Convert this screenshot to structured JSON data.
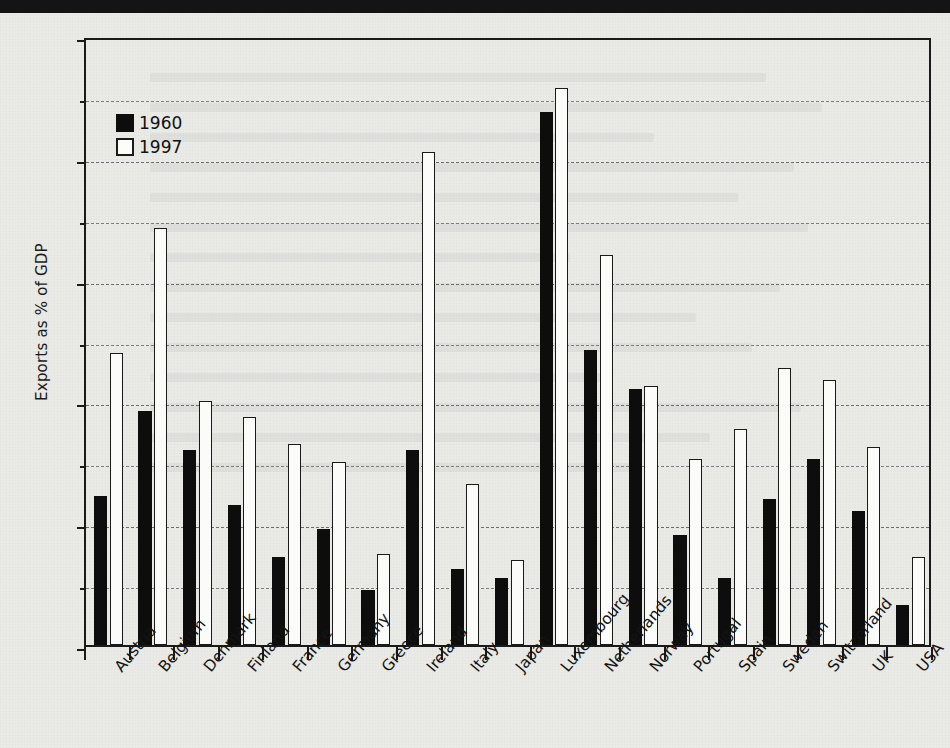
{
  "chart_data": {
    "type": "bar",
    "title": "",
    "subtitle": "",
    "xlabel": "",
    "ylabel": "Exports as % of GDP",
    "ylim": [
      0,
      100
    ],
    "y_ticks": [
      0,
      20,
      40,
      60,
      80,
      100
    ],
    "y_tick_labels": [
      "0",
      "20",
      "40",
      "60",
      "80",
      "100"
    ],
    "y_gridlines": [
      10,
      20,
      30,
      40,
      50,
      60,
      70,
      80,
      90
    ],
    "grid": true,
    "legend_position": "top-left",
    "categories": [
      "Austria",
      "Belgium",
      "Denmark",
      "Finland",
      "France",
      "Germany",
      "Greece",
      "Ireland",
      "Italy",
      "Japan",
      "Luxembourg",
      "Netherlands",
      "Norway",
      "Portugal",
      "Spain",
      "Sweden",
      "Switzerland",
      "UK",
      "USA"
    ],
    "series": [
      {
        "name": "1960",
        "color": "#0d0d0d",
        "values": [
          24.5,
          38.5,
          32.0,
          23.0,
          14.5,
          19.0,
          9.0,
          32.0,
          12.5,
          11.0,
          87.5,
          48.5,
          42.0,
          18.0,
          11.0,
          24.0,
          30.5,
          22.0,
          6.5
        ]
      },
      {
        "name": "1997",
        "color": "#fbfbfa",
        "values": [
          48.0,
          68.5,
          40.0,
          37.5,
          33.0,
          30.0,
          15.0,
          81.0,
          26.5,
          14.0,
          91.5,
          64.0,
          42.5,
          30.5,
          35.5,
          45.5,
          43.5,
          32.5,
          14.5
        ]
      }
    ]
  },
  "legend": {
    "items": [
      {
        "label": "1960",
        "swatch": "filled-black-square"
      },
      {
        "label": "1997",
        "swatch": "outlined-white-square"
      }
    ]
  },
  "colors": {
    "series_1960": "#0d0d0d",
    "series_1997": "#fbfbfa",
    "axis": "#1a1a1a",
    "gridline": "#6b6b6b",
    "background": "#eaeae7"
  }
}
